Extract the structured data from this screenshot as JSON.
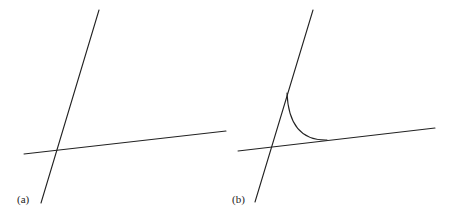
{
  "panels": [
    {
      "id": "a",
      "label": "(a)",
      "description": "Two straight lines intersecting",
      "lines": [
        {
          "name": "steep-line",
          "x1": 99,
          "y1": 10,
          "x2": 41,
          "y2": 203
        },
        {
          "name": "shallow-line",
          "x1": 24,
          "y1": 154,
          "x2": 226,
          "y2": 131
        }
      ]
    },
    {
      "id": "b",
      "label": "(b)",
      "description": "Two intersecting lines with a concave fillet arc tangent to both",
      "lines": [
        {
          "name": "steep-line",
          "x1": 313,
          "y1": 10,
          "x2": 255,
          "y2": 202
        },
        {
          "name": "shallow-line",
          "x1": 238,
          "y1": 151,
          "x2": 435,
          "y2": 128
        }
      ],
      "arc": {
        "start": [
          287,
          93
        ],
        "control": [
          289,
          141
        ],
        "end": [
          327,
          140
        ]
      }
    }
  ],
  "colors": {
    "stroke": "#222222",
    "background": "#ffffff"
  }
}
